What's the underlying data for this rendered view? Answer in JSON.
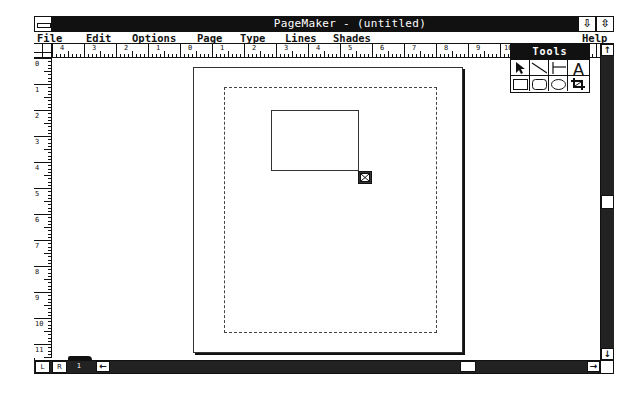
{
  "window": {
    "title": "PageMaker - (untitled)",
    "minimize_icon": "arrow-down-icon",
    "maximize_icon": "arrow-updown-icon",
    "minimize_glyph": "⇩",
    "maximize_glyph": "⇳"
  },
  "menu": {
    "items": [
      {
        "label": "File",
        "mnemonic": "F",
        "rest": "ile"
      },
      {
        "label": "Edit",
        "mnemonic": "E",
        "rest": "dit"
      },
      {
        "label": "Options",
        "mnemonic": "O",
        "rest": "ptions"
      },
      {
        "label": "Page",
        "mnemonic": "P",
        "rest": "age"
      },
      {
        "label": "Type",
        "mnemonic": "T",
        "rest": "ype"
      },
      {
        "label": "Lines",
        "mnemonic": "L",
        "rest": "ines"
      },
      {
        "label": "Shades",
        "mnemonic": "S",
        "rest": "hades"
      },
      {
        "label": "Help",
        "mnemonic": "H",
        "rest": "elp"
      }
    ]
  },
  "rulers": {
    "horizontal_labels": [
      "4",
      "3",
      "2",
      "1",
      "0",
      "1",
      "2",
      "3",
      "4",
      "5",
      "6",
      "7",
      "8",
      "9",
      "10"
    ],
    "vertical_labels": [
      "0",
      "1",
      "2",
      "3",
      "4",
      "5",
      "6",
      "7",
      "8",
      "9",
      "10",
      "11"
    ],
    "unit": "inches"
  },
  "toolbox": {
    "title": "Tools",
    "tools": [
      {
        "name": "pointer",
        "icon": "pointer-arrow-icon"
      },
      {
        "name": "diagonal-line",
        "icon": "diagonal-line-icon"
      },
      {
        "name": "perpendicular-line",
        "icon": "perpendicular-line-icon"
      },
      {
        "name": "text",
        "icon": "text-tool-icon",
        "glyph": "A"
      },
      {
        "name": "square-corner-rectangle",
        "icon": "rectangle-icon"
      },
      {
        "name": "rounded-rectangle",
        "icon": "rounded-rectangle-icon"
      },
      {
        "name": "oval",
        "icon": "oval-icon"
      },
      {
        "name": "cropping",
        "icon": "crop-icon"
      }
    ]
  },
  "scrollbars": {
    "up_arrow": "↑",
    "down_arrow": "↓",
    "left_arrow": "←",
    "right_arrow": "→"
  },
  "page_icons": {
    "left": "L",
    "right": "R",
    "page_number": "1"
  },
  "colors": {
    "titlebar": "#111111",
    "scroll_track": "#222222",
    "page": "#ffffff"
  }
}
